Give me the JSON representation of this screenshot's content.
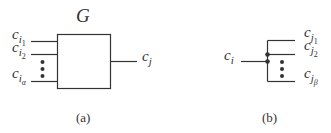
{
  "figure_a": {
    "title": "G",
    "inputs": [
      {
        "base": "c",
        "sub": "i",
        "subsub": "1"
      },
      {
        "base": "c",
        "sub": "i",
        "subsub": "2"
      },
      {
        "base": "c",
        "sub": "i",
        "subsub": "α"
      }
    ],
    "output": {
      "base": "c",
      "sub": "j"
    },
    "caption": "(a)"
  },
  "figure_b": {
    "input": {
      "base": "c",
      "sub": "i"
    },
    "outputs": [
      {
        "base": "c",
        "sub": "j",
        "subsub": "1"
      },
      {
        "base": "c",
        "sub": "j",
        "subsub": "2"
      },
      {
        "base": "c",
        "sub": "j",
        "subsub": "β"
      }
    ],
    "caption": "(b)"
  },
  "colors": {
    "stroke": "#333333",
    "background": "#ffffff"
  }
}
